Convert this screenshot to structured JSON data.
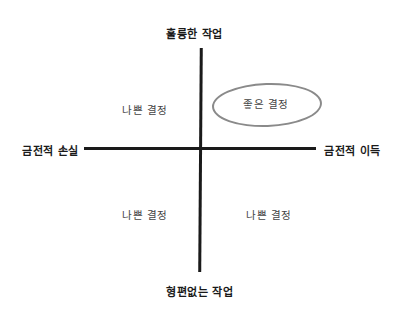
{
  "diagram": {
    "type": "quadrant",
    "axes": {
      "top": "훌륭한 작업",
      "bottom": "형편없는 작업",
      "left": "금전적 손실",
      "right": "금전적 이득"
    },
    "quadrants": {
      "top_left": "나쁜 결정",
      "top_right": "좋은 결정",
      "bottom_left": "나쁜 결정",
      "bottom_right": "나쁜 결정"
    },
    "highlight": {
      "quadrant": "top_right",
      "shape": "oval",
      "stroke_color": "#8a8a8a"
    },
    "colors": {
      "axis_line": "#1a1a1a",
      "text": "#222222",
      "background": "#ffffff"
    }
  }
}
